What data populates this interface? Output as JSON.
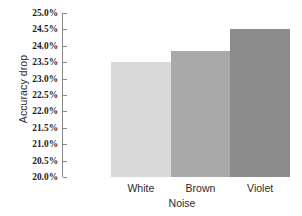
{
  "chart_data": {
    "type": "bar",
    "title": "",
    "subtitle": "",
    "xlabel": "Noise",
    "ylabel": "Accuracy drop",
    "categories": [
      "White",
      "Brown",
      "Violet"
    ],
    "values": [
      23.5,
      23.85,
      24.5
    ],
    "value_labels": [
      "23.5%",
      "23.85%",
      "24.5%"
    ],
    "ylim": [
      20.0,
      25.0
    ],
    "ytick_labels": [
      "25.0%",
      "24.5%",
      "24.0%",
      "23.5%",
      "23.0%",
      "22.5%",
      "22.0%",
      "21.5%",
      "21.0%",
      "20.5%",
      "20.0%"
    ],
    "ytick_values": [
      25.0,
      24.5,
      24.0,
      23.5,
      23.0,
      22.5,
      22.0,
      21.5,
      21.0,
      20.5,
      20.0
    ],
    "grid": false,
    "legend": false,
    "legend_position": "none",
    "bar_colors": [
      "#d9d9d9",
      "#a9a9a9",
      "#8c8c8c"
    ],
    "axis_color": "#8a8a8a",
    "background": "#ffffff",
    "series": [
      {
        "name": "Accuracy drop",
        "values": [
          23.5,
          23.85,
          24.5
        ]
      }
    ]
  }
}
